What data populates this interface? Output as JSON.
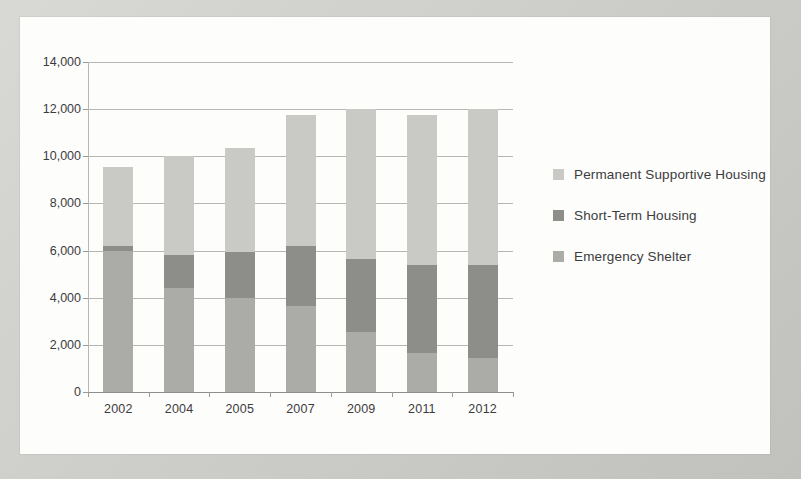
{
  "chart_data": {
    "type": "bar",
    "subtype": "stacked-vertical",
    "title": "",
    "xlabel": "",
    "ylabel": "",
    "categories": [
      "2002",
      "2004",
      "2005",
      "2007",
      "2009",
      "2011",
      "2012"
    ],
    "series": [
      {
        "name": "Emergency Shelter",
        "color": "#ababa8",
        "values": [
          6000,
          4400,
          4000,
          3650,
          2550,
          1650,
          1450
        ]
      },
      {
        "name": "Short-Term Housing",
        "color": "#8d8d8a",
        "values": [
          200,
          1400,
          1950,
          2550,
          3100,
          3750,
          3950
        ]
      },
      {
        "name": "Permanent Supportive Housing",
        "color": "#c9c9c6",
        "values": [
          3350,
          4200,
          4400,
          5550,
          6350,
          6350,
          6600
        ]
      }
    ],
    "totals": [
      9550,
      10000,
      10350,
      11750,
      12000,
      11750,
      12000
    ],
    "ylim": [
      0,
      14000
    ],
    "ytick_values": [
      0,
      2000,
      4000,
      6000,
      8000,
      10000,
      12000,
      14000
    ],
    "ytick_labels": [
      "0",
      "2,000",
      "4,000",
      "6,000",
      "8,000",
      "10,000",
      "12,000",
      "14,000"
    ],
    "grid": true,
    "legend_position": "right",
    "legend_order": [
      "Permanent Supportive Housing",
      "Short-Term Housing",
      "Emergency Shelter"
    ]
  },
  "legend": {
    "items": [
      {
        "label": "Permanent Supportive Housing",
        "color": "#c9c9c6"
      },
      {
        "label": "Short-Term Housing",
        "color": "#8d8d8a"
      },
      {
        "label": "Emergency Shelter",
        "color": "#ababa8"
      }
    ]
  },
  "colors": {
    "page_background": "#cbcbc7",
    "panel_background": "#fdfdfc",
    "gridline": "#b6b6b2",
    "axis": "#8f8f8c",
    "text": "#3c3c3c"
  }
}
